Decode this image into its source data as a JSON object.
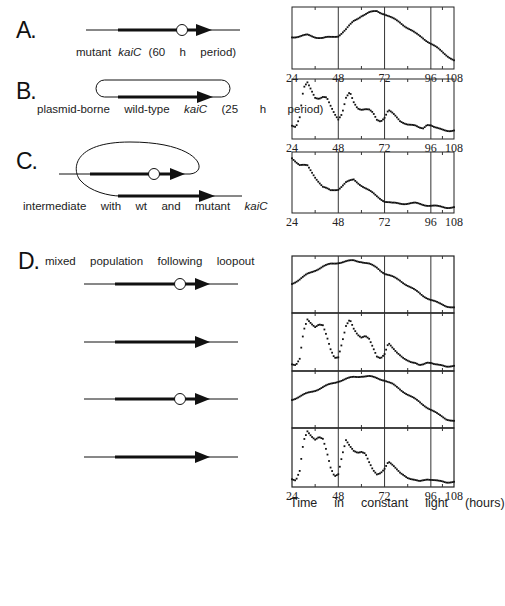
{
  "figure": {
    "panels": [
      {
        "letter": "A.",
        "caption_pre": "mutant ",
        "caption_gene": "kaiC",
        "caption_post": " (60  h  period)"
      },
      {
        "letter": "B.",
        "caption_pre": "plasmid-borne  wild-type  ",
        "caption_gene": "kaiC",
        "caption_post": "  (25   h   period)"
      },
      {
        "letter": "C.",
        "caption_pre": "intermediate  with  wt  and  mutant  ",
        "caption_gene": "kaiC",
        "caption_post": ""
      },
      {
        "letter": "D.",
        "caption_pre": "mixed  population  following  loopout",
        "caption_gene": "",
        "caption_post": ""
      }
    ],
    "x_axis_label": "Time  in  constant  light  (hours)",
    "x_ticks": [
      "24",
      "48",
      "72",
      "96",
      "108"
    ]
  },
  "chart_data": [
    {
      "id": "A",
      "type": "scatter",
      "title": "mutant kaiC (60 h period)",
      "xlabel": "",
      "ylabel": "",
      "xlim": [
        24,
        108
      ],
      "x_ticks": [
        24,
        48,
        72,
        96,
        108
      ],
      "grid": "vertical at 48,72,96",
      "x": [
        24,
        28,
        32,
        36,
        40,
        44,
        48,
        52,
        56,
        60,
        64,
        68,
        72,
        76,
        80,
        84,
        88,
        92,
        96,
        100,
        104,
        108
      ],
      "values": [
        0.52,
        0.53,
        0.55,
        0.52,
        0.5,
        0.51,
        0.54,
        0.65,
        0.8,
        0.9,
        0.95,
        0.98,
        0.93,
        0.85,
        0.78,
        0.68,
        0.58,
        0.5,
        0.4,
        0.3,
        0.2,
        0.1
      ]
    },
    {
      "id": "B",
      "type": "scatter",
      "title": "plasmid-borne wild-type kaiC (25 h period)",
      "xlim": [
        24,
        108
      ],
      "x_ticks": [
        24,
        48,
        72,
        96,
        108
      ],
      "x": [
        24,
        26,
        28,
        30,
        32,
        34,
        36,
        38,
        40,
        42,
        44,
        46,
        48,
        50,
        52,
        54,
        56,
        58,
        60,
        62,
        64,
        66,
        68,
        70,
        72,
        74,
        76,
        78,
        80,
        82,
        84,
        86,
        88,
        90,
        92,
        94,
        96,
        98,
        100,
        102,
        104,
        106,
        108
      ],
      "values": [
        0.2,
        0.18,
        0.35,
        0.88,
        0.98,
        0.85,
        0.72,
        0.7,
        0.72,
        0.7,
        0.55,
        0.42,
        0.32,
        0.42,
        0.7,
        0.8,
        0.62,
        0.52,
        0.5,
        0.5,
        0.48,
        0.42,
        0.3,
        0.28,
        0.35,
        0.48,
        0.42,
        0.35,
        0.28,
        0.25,
        0.22,
        0.2,
        0.18,
        0.15,
        0.15,
        0.22,
        0.2,
        0.15,
        0.13,
        0.12,
        0.11,
        0.1,
        0.1
      ]
    },
    {
      "id": "C",
      "type": "scatter",
      "title": "intermediate with wt and mutant kaiC",
      "xlim": [
        24,
        108
      ],
      "x_ticks": [
        24,
        48,
        72,
        96,
        108
      ],
      "x": [
        24,
        28,
        32,
        36,
        40,
        44,
        48,
        52,
        56,
        60,
        64,
        68,
        72,
        76,
        80,
        84,
        88,
        92,
        96,
        100,
        104,
        108
      ],
      "values": [
        0.95,
        0.82,
        0.8,
        0.6,
        0.42,
        0.35,
        0.38,
        0.5,
        0.55,
        0.45,
        0.35,
        0.25,
        0.16,
        0.12,
        0.12,
        0.12,
        0.12,
        0.1,
        0.08,
        0.06,
        0.05,
        0.05
      ]
    },
    {
      "id": "D1",
      "type": "scatter",
      "title": "mixed population trace 1 (mutant-like)",
      "xlim": [
        24,
        108
      ],
      "x_ticks": [
        24,
        48,
        72,
        96,
        108
      ],
      "x": [
        24,
        28,
        32,
        36,
        40,
        44,
        48,
        52,
        56,
        60,
        64,
        68,
        72,
        76,
        80,
        84,
        88,
        92,
        96,
        100,
        104,
        108
      ],
      "values": [
        0.52,
        0.6,
        0.7,
        0.78,
        0.85,
        0.9,
        0.93,
        0.95,
        0.97,
        0.95,
        0.9,
        0.83,
        0.72,
        0.65,
        0.58,
        0.48,
        0.38,
        0.28,
        0.2,
        0.13,
        0.08,
        0.05
      ]
    },
    {
      "id": "D2",
      "type": "scatter",
      "title": "mixed population trace 2 (wild-type-like)",
      "xlim": [
        24,
        108
      ],
      "x_ticks": [
        24,
        48,
        72,
        96,
        108
      ],
      "x": [
        24,
        26,
        28,
        30,
        32,
        34,
        36,
        38,
        40,
        42,
        44,
        46,
        48,
        50,
        52,
        54,
        56,
        58,
        60,
        62,
        64,
        66,
        68,
        70,
        72,
        74,
        76,
        78,
        80,
        82,
        84,
        86,
        88,
        90,
        92,
        94,
        96,
        98,
        100,
        102,
        104,
        106,
        108
      ],
      "values": [
        0.08,
        0.07,
        0.18,
        0.7,
        0.92,
        0.85,
        0.8,
        0.85,
        0.82,
        0.6,
        0.35,
        0.2,
        0.22,
        0.5,
        0.8,
        0.92,
        0.75,
        0.65,
        0.6,
        0.62,
        0.55,
        0.38,
        0.22,
        0.2,
        0.28,
        0.48,
        0.38,
        0.3,
        0.25,
        0.2,
        0.15,
        0.1,
        0.08,
        0.05,
        0.08,
        0.12,
        0.1,
        0.06,
        0.05,
        0.05,
        0.04,
        0.04,
        0.04
      ]
    },
    {
      "id": "D3",
      "type": "scatter",
      "title": "mixed population trace 3 (mutant-like)",
      "xlim": [
        24,
        108
      ],
      "x_ticks": [
        24,
        48,
        72,
        96,
        108
      ],
      "x": [
        24,
        28,
        32,
        36,
        40,
        44,
        48,
        52,
        56,
        60,
        64,
        68,
        72,
        76,
        80,
        84,
        88,
        92,
        96,
        100,
        104,
        108
      ],
      "values": [
        0.5,
        0.56,
        0.62,
        0.68,
        0.74,
        0.8,
        0.86,
        0.9,
        0.94,
        0.96,
        0.95,
        0.92,
        0.88,
        0.8,
        0.7,
        0.6,
        0.5,
        0.4,
        0.3,
        0.2,
        0.12,
        0.08
      ]
    },
    {
      "id": "D4",
      "type": "scatter",
      "title": "mixed population trace 4 (wild-type-like)",
      "xlim": [
        24,
        108
      ],
      "x_ticks": [
        24,
        48,
        72,
        96,
        108
      ],
      "x": [
        24,
        26,
        28,
        30,
        32,
        34,
        36,
        38,
        40,
        42,
        44,
        46,
        48,
        50,
        52,
        54,
        56,
        58,
        60,
        62,
        64,
        66,
        68,
        70,
        72,
        74,
        76,
        78,
        80,
        82,
        84,
        86,
        88,
        90,
        92,
        94,
        96,
        98,
        100,
        102,
        104,
        106,
        108
      ],
      "values": [
        0.1,
        0.08,
        0.25,
        0.8,
        0.98,
        0.9,
        0.85,
        0.9,
        0.85,
        0.6,
        0.3,
        0.15,
        0.2,
        0.55,
        0.82,
        0.7,
        0.62,
        0.6,
        0.62,
        0.58,
        0.4,
        0.25,
        0.18,
        0.22,
        0.3,
        0.42,
        0.35,
        0.28,
        0.22,
        0.18,
        0.12,
        0.08,
        0.06,
        0.05,
        0.08,
        0.1,
        0.08,
        0.06,
        0.05,
        0.05,
        0.04,
        0.04,
        0.04
      ]
    }
  ]
}
